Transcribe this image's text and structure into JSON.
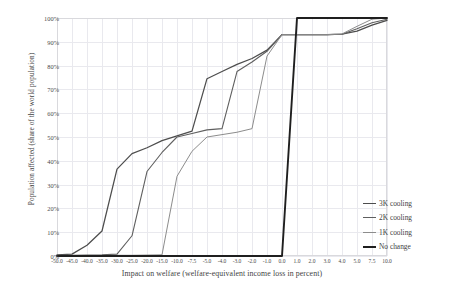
{
  "chart_data": {
    "type": "line",
    "title": "",
    "xlabel": "Impact on welfare (welfare-equivalent income loss in percent)",
    "ylabel": "Population affected (share of the world population)",
    "grid": true,
    "legend_position": "right-bottom",
    "x_axis_scale": "categorical",
    "categories": [
      "-50.0",
      "-45.0",
      "-40.0",
      "-35.0",
      "-30.0",
      "-25.0",
      "-20.0",
      "-15.0",
      "-10.0",
      "-7.5",
      "-5.0",
      "-4.0",
      "-3.0",
      "-2.0",
      "-1.0",
      "0.0",
      "1.0",
      "2.0",
      "3.0",
      "4.0",
      "5.0",
      "7.5",
      "10.0"
    ],
    "ytick_labels": [
      "0%",
      "10%",
      "20%",
      "30%",
      "40%",
      "50%",
      "60%",
      "70%",
      "80%",
      "90%",
      "100%"
    ],
    "ytick_values": [
      0,
      10,
      20,
      30,
      40,
      50,
      60,
      70,
      80,
      90,
      100
    ],
    "ylim": [
      0,
      100
    ],
    "yunit": "%",
    "series": [
      {
        "name": "3K cooling",
        "color": "#4d4d4d",
        "width": 1.25,
        "values": [
          0.5,
          0.8,
          4.5,
          10.5,
          36.5,
          43.0,
          45.5,
          48.5,
          50.5,
          52.5,
          74.5,
          77.5,
          80.5,
          83.0,
          86.5,
          93.0,
          93.0,
          93.0,
          93.0,
          93.2,
          94.5,
          97.0,
          99.0
        ]
      },
      {
        "name": "2K cooling",
        "color": "#5f5f5f",
        "width": 1.1,
        "values": [
          0.3,
          0.3,
          0.4,
          0.5,
          0.8,
          8.5,
          35.5,
          43.5,
          50.0,
          51.5,
          53.0,
          53.5,
          77.5,
          81.5,
          86.0,
          93.0,
          93.0,
          93.0,
          93.0,
          93.2,
          95.5,
          98.0,
          99.5
        ]
      },
      {
        "name": "1K cooling",
        "color": "#8c8c8c",
        "width": 1.0,
        "values": [
          0.2,
          0.2,
          0.2,
          0.2,
          0.3,
          0.3,
          0.4,
          0.5,
          33.5,
          44.0,
          50.0,
          51.0,
          52.0,
          53.5,
          84.0,
          93.0,
          93.0,
          93.0,
          93.0,
          93.3,
          96.5,
          99.5,
          100.0
        ]
      },
      {
        "name": "No change",
        "color": "#1f1f1f",
        "width": 1.9,
        "values": [
          0,
          0,
          0,
          0,
          0,
          0,
          0,
          0,
          0,
          0,
          0,
          0,
          0,
          0,
          0,
          0,
          100,
          100,
          100,
          100,
          100,
          100,
          100
        ]
      }
    ]
  },
  "legend": {
    "items": [
      {
        "label": "3K cooling",
        "color": "#4d4d4d",
        "width": 1.6
      },
      {
        "label": "2K cooling",
        "color": "#5f5f5f",
        "width": 1.4
      },
      {
        "label": "1K cooling",
        "color": "#8c8c8c",
        "width": 1.1
      },
      {
        "label": "No change",
        "color": "#1f1f1f",
        "width": 2.4
      }
    ]
  },
  "colors": {
    "grid": "#e9e9ee",
    "frame": "#d9d9dd",
    "text": "#3f3f3f",
    "background": "#ffffff"
  }
}
